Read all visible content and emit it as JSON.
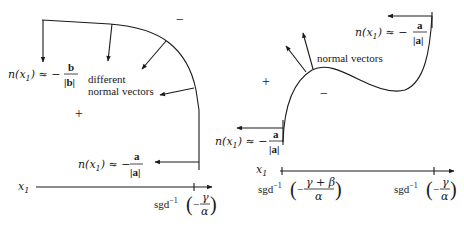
{
  "left_panel": {
    "top_sign": "−",
    "inner_sign": "+",
    "label_b": {
      "lhs": "n(x",
      "sub": "1",
      "rhs": ") ≈ −",
      "num": "b",
      "den": "|b|"
    },
    "label_a": {
      "lhs": "n(x",
      "sub": "1",
      "rhs": ") ≈ −",
      "num": "a",
      "den": "|a|"
    },
    "annotation_line1": "different",
    "annotation_line2": "normal vectors",
    "axis_label": "x",
    "axis_label_sub": "1",
    "tick_label": {
      "func": "sgd",
      "sup": "−1",
      "num": "γ",
      "den": "α",
      "sign": "−"
    }
  },
  "right_panel": {
    "outer_sign": "+",
    "inner_sign": "−",
    "label_top": {
      "lhs": "n(x",
      "sub": "1",
      "rhs": ") ≈ −",
      "num": "a",
      "den": "|a|"
    },
    "label_bottom": {
      "lhs": "n(x",
      "sub": "1",
      "rhs": ") ≈ −",
      "num": "a",
      "den": "|a|"
    },
    "annotation": "normal vectors",
    "axis_label": "x",
    "axis_label_sub": "1",
    "tick_label_left": {
      "func": "sgd",
      "sup": "−1",
      "num": "γ + β",
      "den": "α",
      "sign": "−"
    },
    "tick_label_right": {
      "func": "sgd",
      "sup": "−1",
      "num": "γ",
      "den": "α",
      "sign": "−"
    }
  }
}
